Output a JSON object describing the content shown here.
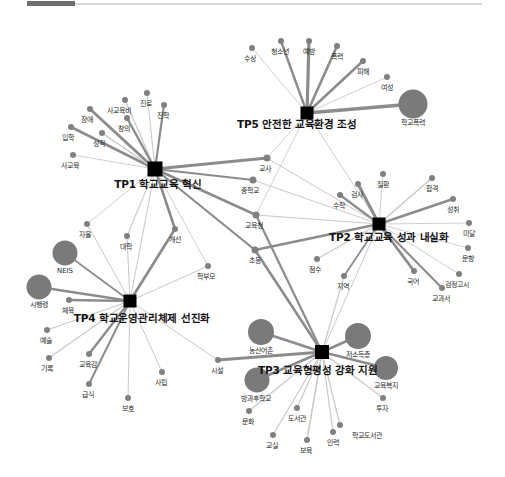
{
  "meta": {
    "width": 505,
    "height": 477,
    "background": "#ffffff"
  },
  "top_strip": {
    "name": "scroll-progress-strip",
    "thumb_color": "#6e6e6e",
    "rail_color": "#d8d8d8"
  },
  "colors": {
    "hub": "#000000",
    "node": "#808080",
    "big_node": "#7a7a7a",
    "edge_strong": "#8c8c8c",
    "edge_weak": "#c9c9c9",
    "label": "#2b2b2b"
  },
  "chart_data": {
    "type": "network",
    "hubs": [
      {
        "id": "TP1",
        "label": "TP1 학교교육 혁신",
        "x": 155,
        "y": 169,
        "size": 15,
        "label_x": 158,
        "label_y": 179
      },
      {
        "id": "TP2",
        "label": "TP2 학교교육 성과 내실화",
        "x": 379,
        "y": 224,
        "size": 13,
        "label_x": 389,
        "label_y": 232
      },
      {
        "id": "TP3",
        "label": "TP3 교육형평성 강화 지원",
        "x": 322,
        "y": 352,
        "size": 14,
        "label_x": 318,
        "label_y": 365
      },
      {
        "id": "TP4",
        "label": "TP4 학교운영관리체제 선진화",
        "x": 130,
        "y": 301,
        "size": 13,
        "label_x": 142,
        "label_y": 313
      },
      {
        "id": "TP5",
        "label": "TP5 안전한 교육환경 조성",
        "x": 307,
        "y": 113,
        "size": 13,
        "label_x": 297,
        "label_y": 119
      }
    ],
    "nodes": [
      {
        "label": "수상",
        "x": 252,
        "y": 48,
        "r": 3.0,
        "lx": 250,
        "ly": 56
      },
      {
        "label": "청소년",
        "x": 281,
        "y": 41,
        "r": 3.0,
        "lx": 280,
        "ly": 49
      },
      {
        "label": "예방",
        "x": 309,
        "y": 41,
        "r": 3.0,
        "lx": 309,
        "ly": 49
      },
      {
        "label": "폭력",
        "x": 337,
        "y": 46,
        "r": 3.0,
        "lx": 337,
        "ly": 54
      },
      {
        "label": "피해",
        "x": 363,
        "y": 61,
        "r": 3.0,
        "lx": 363,
        "ly": 69
      },
      {
        "label": "여성",
        "x": 387,
        "y": 77,
        "r": 3.0,
        "lx": 387,
        "ly": 85
      },
      {
        "label": "학교폭력",
        "x": 413,
        "y": 104,
        "r": 14.5,
        "lx": 413,
        "ly": 120
      },
      {
        "label": "사교육비",
        "x": 125,
        "y": 100,
        "r": 3.0,
        "lx": 119,
        "ly": 108
      },
      {
        "label": "진로",
        "x": 147,
        "y": 93,
        "r": 3.0,
        "lx": 146,
        "ly": 101
      },
      {
        "label": "진학",
        "x": 164,
        "y": 105,
        "r": 3.0,
        "lx": 163,
        "ly": 113
      },
      {
        "label": "장애",
        "x": 90,
        "y": 109,
        "r": 3.0,
        "lx": 87,
        "ly": 117
      },
      {
        "label": "창의",
        "x": 127,
        "y": 118,
        "r": 3.0,
        "lx": 124,
        "ly": 126
      },
      {
        "label": "입학",
        "x": 71,
        "y": 127,
        "r": 3.0,
        "lx": 68,
        "ly": 135
      },
      {
        "label": "성적",
        "x": 102,
        "y": 133,
        "r": 3.0,
        "lx": 99,
        "ly": 141
      },
      {
        "label": "사교육",
        "x": 73,
        "y": 155,
        "r": 3.0,
        "lx": 70,
        "ly": 163
      },
      {
        "label": "교사",
        "x": 267,
        "y": 158,
        "r": 3.5,
        "lx": 265,
        "ly": 166
      },
      {
        "label": "중학교",
        "x": 253,
        "y": 180,
        "r": 3.5,
        "lx": 250,
        "ly": 188
      },
      {
        "label": "교육청",
        "x": 256,
        "y": 215,
        "r": 3.5,
        "lx": 254,
        "ly": 223
      },
      {
        "label": "초등",
        "x": 255,
        "y": 250,
        "r": 3.5,
        "lx": 255,
        "ly": 258
      },
      {
        "label": "학부모",
        "x": 208,
        "y": 266,
        "r": 3.0,
        "lx": 206,
        "ly": 274
      },
      {
        "label": "수학",
        "x": 340,
        "y": 195,
        "r": 3.0,
        "lx": 339,
        "ly": 203
      },
      {
        "label": "검사",
        "x": 358,
        "y": 184,
        "r": 3.0,
        "lx": 357,
        "ly": 192
      },
      {
        "label": "질환",
        "x": 383,
        "y": 174,
        "r": 3.0,
        "lx": 383,
        "ly": 182
      },
      {
        "label": "합격",
        "x": 432,
        "y": 178,
        "r": 3.0,
        "lx": 432,
        "ly": 186
      },
      {
        "label": "성취",
        "x": 453,
        "y": 199,
        "r": 3.0,
        "lx": 453,
        "ly": 207
      },
      {
        "label": "미달",
        "x": 469,
        "y": 223,
        "r": 3.0,
        "lx": 469,
        "ly": 231
      },
      {
        "label": "문항",
        "x": 468,
        "y": 248,
        "r": 3.0,
        "lx": 468,
        "ly": 256
      },
      {
        "label": "검정고시",
        "x": 459,
        "y": 274,
        "r": 3.0,
        "lx": 457,
        "ly": 282
      },
      {
        "label": "점수",
        "x": 317,
        "y": 259,
        "r": 3.0,
        "lx": 315,
        "ly": 267
      },
      {
        "label": "국어",
        "x": 414,
        "y": 271,
        "r": 3.0,
        "lx": 413,
        "ly": 279
      },
      {
        "label": "지역",
        "x": 344,
        "y": 276,
        "r": 3.0,
        "lx": 343,
        "ly": 284
      },
      {
        "label": "교과서",
        "x": 442,
        "y": 288,
        "r": 3.0,
        "lx": 441,
        "ly": 296
      },
      {
        "label": "자율",
        "x": 87,
        "y": 224,
        "r": 3.0,
        "lx": 85,
        "ly": 232
      },
      {
        "label": "대학",
        "x": 127,
        "y": 236,
        "r": 3.0,
        "lx": 126,
        "ly": 244
      },
      {
        "label": "개선",
        "x": 175,
        "y": 229,
        "r": 3.0,
        "lx": 175,
        "ly": 237
      },
      {
        "label": "NEIS",
        "x": 65,
        "y": 253,
        "r": 12.5,
        "lx": 65,
        "ly": 268
      },
      {
        "label": "시행령",
        "x": 39,
        "y": 287,
        "r": 12.5,
        "lx": 39,
        "ly": 302
      },
      {
        "label": "체육",
        "x": 69,
        "y": 300,
        "r": 3.0,
        "lx": 68,
        "ly": 308
      },
      {
        "label": "예술",
        "x": 47,
        "y": 330,
        "r": 3.0,
        "lx": 46,
        "ly": 338
      },
      {
        "label": "기록",
        "x": 49,
        "y": 358,
        "r": 3.0,
        "lx": 47,
        "ly": 366
      },
      {
        "label": "교육감",
        "x": 89,
        "y": 354,
        "r": 3.0,
        "lx": 88,
        "ly": 362
      },
      {
        "label": "급식",
        "x": 89,
        "y": 384,
        "r": 3.0,
        "lx": 88,
        "ly": 392
      },
      {
        "label": "보호",
        "x": 128,
        "y": 398,
        "r": 3.0,
        "lx": 128,
        "ly": 406
      },
      {
        "label": "사립",
        "x": 162,
        "y": 372,
        "r": 3.0,
        "lx": 161,
        "ly": 380
      },
      {
        "label": "시설",
        "x": 218,
        "y": 360,
        "r": 3.0,
        "lx": 217,
        "ly": 368
      },
      {
        "label": "농산어촌",
        "x": 261,
        "y": 332,
        "r": 13.0,
        "lx": 261,
        "ly": 348
      },
      {
        "label": "저소득층",
        "x": 358,
        "y": 336,
        "r": 13.0,
        "lx": 358,
        "ly": 352
      },
      {
        "label": "교육복지",
        "x": 386,
        "y": 368,
        "r": 12.0,
        "lx": 386,
        "ly": 383
      },
      {
        "label": "투자",
        "x": 383,
        "y": 398,
        "r": 3.0,
        "lx": 382,
        "ly": 406
      },
      {
        "label": "방과후학교",
        "x": 257,
        "y": 380,
        "r": 12.5,
        "lx": 256,
        "ly": 396
      },
      {
        "label": "문화",
        "x": 249,
        "y": 411,
        "r": 3.0,
        "lx": 248,
        "ly": 419
      },
      {
        "label": "도서관",
        "x": 297,
        "y": 408,
        "r": 3.0,
        "lx": 297,
        "ly": 416
      },
      {
        "label": "교실",
        "x": 273,
        "y": 435,
        "r": 3.0,
        "lx": 272,
        "ly": 443
      },
      {
        "label": "보육",
        "x": 307,
        "y": 440,
        "r": 3.0,
        "lx": 306,
        "ly": 448
      },
      {
        "label": "인력",
        "x": 333,
        "y": 432,
        "r": 3.0,
        "lx": 333,
        "ly": 440
      },
      {
        "label": "학교도서관",
        "x": 340,
        "y": 425,
        "r": 3.0,
        "lx": 367,
        "ly": 433
      }
    ],
    "edges": [
      {
        "from": "TP5",
        "to": "수상",
        "w": 0.9
      },
      {
        "from": "TP5",
        "to": "청소년",
        "w": 2.4
      },
      {
        "from": "TP5",
        "to": "예방",
        "w": 3.2
      },
      {
        "from": "TP5",
        "to": "폭력",
        "w": 2.6
      },
      {
        "from": "TP5",
        "to": "피해",
        "w": 2.6
      },
      {
        "from": "TP5",
        "to": "여성",
        "w": 0.9
      },
      {
        "from": "TP5",
        "to": "학교폭력",
        "w": 3.4
      },
      {
        "from": "TP5",
        "to": "교사",
        "w": 0.9
      },
      {
        "from": "TP5",
        "to": "교육청",
        "w": 0.9
      },
      {
        "from": "TP5",
        "to": "TP2",
        "w": 0.9
      },
      {
        "from": "TP1",
        "to": "사교육비",
        "w": 1.3
      },
      {
        "from": "TP1",
        "to": "진로",
        "w": 1.1
      },
      {
        "from": "TP1",
        "to": "진학",
        "w": 2.2
      },
      {
        "from": "TP1",
        "to": "장애",
        "w": 2.8
      },
      {
        "from": "TP1",
        "to": "창의",
        "w": 2.4
      },
      {
        "from": "TP1",
        "to": "입학",
        "w": 2.6
      },
      {
        "from": "TP1",
        "to": "성적",
        "w": 1.5
      },
      {
        "from": "TP1",
        "to": "사교육",
        "w": 0.9
      },
      {
        "from": "TP1",
        "to": "교사",
        "w": 3.0
      },
      {
        "from": "TP1",
        "to": "중학교",
        "w": 2.0
      },
      {
        "from": "TP1",
        "to": "교육청",
        "w": 2.6
      },
      {
        "from": "TP1",
        "to": "초등",
        "w": 2.2
      },
      {
        "from": "TP1",
        "to": "학부모",
        "w": 0.9
      },
      {
        "from": "TP1",
        "to": "자율",
        "w": 0.9
      },
      {
        "from": "TP1",
        "to": "대학",
        "w": 1.1
      },
      {
        "from": "TP1",
        "to": "개선",
        "w": 2.6
      },
      {
        "from": "TP1",
        "to": "TP4",
        "w": 1.0
      },
      {
        "from": "TP2",
        "to": "수학",
        "w": 2.2
      },
      {
        "from": "TP2",
        "to": "검사",
        "w": 3.0
      },
      {
        "from": "TP2",
        "to": "질환",
        "w": 0.9
      },
      {
        "from": "TP2",
        "to": "합격",
        "w": 1.6
      },
      {
        "from": "TP2",
        "to": "성취",
        "w": 2.6
      },
      {
        "from": "TP2",
        "to": "미달",
        "w": 0.9
      },
      {
        "from": "TP2",
        "to": "문항",
        "w": 0.9
      },
      {
        "from": "TP2",
        "to": "검정고시",
        "w": 0.9
      },
      {
        "from": "TP2",
        "to": "점수",
        "w": 1.4
      },
      {
        "from": "TP2",
        "to": "국어",
        "w": 2.8
      },
      {
        "from": "TP2",
        "to": "지역",
        "w": 1.8
      },
      {
        "from": "TP2",
        "to": "교과서",
        "w": 2.0
      },
      {
        "from": "TP2",
        "to": "교사",
        "w": 1.0
      },
      {
        "from": "TP2",
        "to": "중학교",
        "w": 1.0
      },
      {
        "from": "TP2",
        "to": "교육청",
        "w": 1.0
      },
      {
        "from": "TP2",
        "to": "초등",
        "w": 2.6
      },
      {
        "from": "TP2",
        "to": "TP3",
        "w": 1.0
      },
      {
        "from": "TP4",
        "to": "자율",
        "w": 1.0
      },
      {
        "from": "TP4",
        "to": "대학",
        "w": 1.0
      },
      {
        "from": "TP4",
        "to": "개선",
        "w": 2.8
      },
      {
        "from": "TP4",
        "to": "NEIS",
        "w": 1.8
      },
      {
        "from": "TP4",
        "to": "시행령",
        "w": 2.4
      },
      {
        "from": "TP4",
        "to": "체육",
        "w": 2.6
      },
      {
        "from": "TP4",
        "to": "예술",
        "w": 1.2
      },
      {
        "from": "TP4",
        "to": "기록",
        "w": 1.2
      },
      {
        "from": "TP4",
        "to": "교육감",
        "w": 2.4
      },
      {
        "from": "TP4",
        "to": "급식",
        "w": 2.0
      },
      {
        "from": "TP4",
        "to": "보호",
        "w": 1.0
      },
      {
        "from": "TP4",
        "to": "사립",
        "w": 1.0
      },
      {
        "from": "TP4",
        "to": "시설",
        "w": 1.0
      },
      {
        "from": "TP4",
        "to": "학부모",
        "w": 1.0
      },
      {
        "from": "TP3",
        "to": "농산어촌",
        "w": 2.8
      },
      {
        "from": "TP3",
        "to": "저소득층",
        "w": 2.8
      },
      {
        "from": "TP3",
        "to": "교육복지",
        "w": 2.4
      },
      {
        "from": "TP3",
        "to": "투자",
        "w": 1.2
      },
      {
        "from": "TP3",
        "to": "방과후학교",
        "w": 2.6
      },
      {
        "from": "TP3",
        "to": "문화",
        "w": 1.2
      },
      {
        "from": "TP3",
        "to": "도서관",
        "w": 1.2
      },
      {
        "from": "TP3",
        "to": "교실",
        "w": 1.2
      },
      {
        "from": "TP3",
        "to": "보육",
        "w": 1.6
      },
      {
        "from": "TP3",
        "to": "인력",
        "w": 1.2
      },
      {
        "from": "TP3",
        "to": "학교도서관",
        "w": 1.2
      },
      {
        "from": "TP3",
        "to": "시설",
        "w": 2.8
      },
      {
        "from": "TP3",
        "to": "초등",
        "w": 2.6
      },
      {
        "from": "TP3",
        "to": "교육청",
        "w": 2.2
      },
      {
        "from": "TP3",
        "to": "지역",
        "w": 1.2
      }
    ]
  }
}
